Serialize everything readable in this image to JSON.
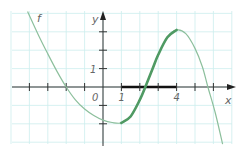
{
  "chart_data": {
    "type": "line",
    "title": "",
    "xlabel": "x",
    "ylabel": "y",
    "origin_label": "0",
    "function_label": "f",
    "xlim": [
      -5,
      7
    ],
    "ylim": [
      -3.1,
      4
    ],
    "grid": true,
    "x_tick_values": [
      -4,
      -3,
      -2,
      -1,
      1,
      2,
      3,
      4,
      5,
      6
    ],
    "x_tick_labels": [
      {
        "value": 1,
        "text": "1"
      },
      {
        "value": 4,
        "text": "4"
      }
    ],
    "y_tick_values": [
      -2,
      -1,
      1,
      2,
      3
    ],
    "y_tick_labels": [
      {
        "value": 1,
        "text": "1"
      }
    ],
    "series": [
      {
        "name": "f",
        "color": "#8cbf9c",
        "points": [
          [
            -4.1,
            4.1
          ],
          [
            -3.5,
            2.8
          ],
          [
            -3,
            1.8
          ],
          [
            -2.5,
            0.85
          ],
          [
            -2,
            0
          ],
          [
            -1.5,
            -0.7
          ],
          [
            -1,
            -1.2
          ],
          [
            -0.5,
            -1.55
          ],
          [
            0,
            -1.8
          ],
          [
            0.5,
            -1.93
          ],
          [
            1,
            -1.95
          ],
          [
            1.5,
            -1.6
          ],
          [
            2,
            -0.7
          ],
          [
            2.3,
            0
          ],
          [
            2.7,
            1.0
          ],
          [
            3,
            1.75
          ],
          [
            3.5,
            2.7
          ],
          [
            4,
            3.1
          ],
          [
            4.5,
            2.9
          ],
          [
            5,
            2.1
          ],
          [
            5.4,
            1.1
          ],
          [
            5.7,
            0
          ],
          [
            6.1,
            -1.4
          ],
          [
            6.5,
            -3.1
          ]
        ]
      }
    ],
    "highlight": {
      "description": "increasing interval",
      "curve_color": "#4f9a63",
      "x_range": [
        1,
        4
      ],
      "axis_segment_color": "#111111"
    }
  }
}
